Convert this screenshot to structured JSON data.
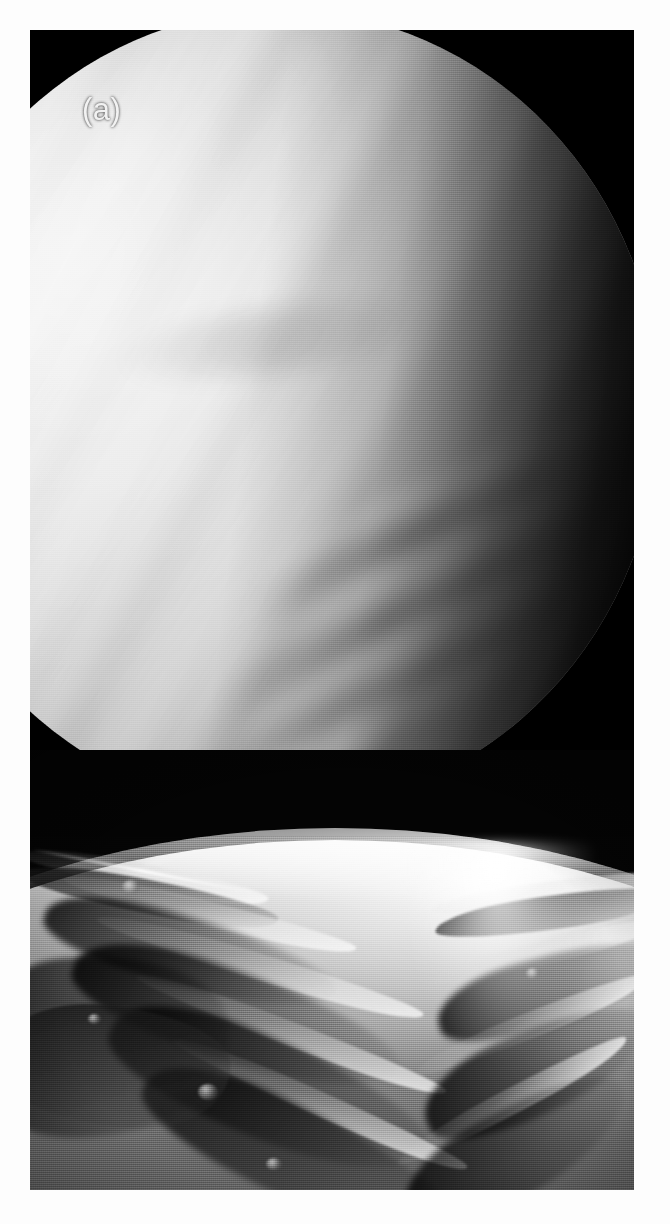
{
  "figure": {
    "kind": "two-panel grayscale astronomy photograph",
    "background_color": "#fdfdfd",
    "frame_color": "#000000",
    "width_px": 670,
    "height_px": 1224
  },
  "panels": [
    {
      "id": "a",
      "label": "(a)",
      "label_color": "#f2f2f2",
      "subject": "Venus cloud-top globe, ultraviolet view",
      "description": "Large bright partially lit planetary disc filling the upper frame, with faint diagonal cloud banding and a dark terminator along the right limb",
      "frame": {
        "x": 30,
        "y": 30,
        "width": 604,
        "height": 720
      },
      "disc": {
        "center_x": 250,
        "center_y": 380,
        "radius_x": 380,
        "radius_y": 400,
        "bright_side": "upper-left",
        "terminator_side": "right"
      },
      "cloud_streak_angle_deg": -26,
      "cloud_streak_count": 4
    },
    {
      "id": "b",
      "label": "(b)",
      "label_color": "#f2f2f2",
      "subject": "Oblique surface view across a rift valley toward the limb with the Sun above the horizon",
      "description": "Dark sky at top with a bright glowing Sun; the curved bright planetary limb crosses the middle; rugged parallel ridges and canyon shadows fill the foreground",
      "frame": {
        "x": 30,
        "y": 750,
        "width": 604,
        "height": 440
      },
      "sun": {
        "center_x": 476,
        "center_y": 797,
        "core_radius": 30,
        "halo_radius": 90,
        "color": "#ffffff"
      },
      "horizon": {
        "y_at_center": 840,
        "y_at_edges": 858,
        "curvature": "convex-up"
      },
      "glint_column": {
        "x": 382,
        "width": 230,
        "description": "specular bright column of sunlight down the valley floor"
      }
    }
  ],
  "colors": {
    "paper": "#fdfdfd",
    "frame_black": "#000000",
    "cloud_bright": "#efefef",
    "cloud_mid": "#b4b4b4",
    "terrain_mid": "#757575",
    "terrain_shadow": "#141414",
    "highlight": "#ffffff"
  }
}
